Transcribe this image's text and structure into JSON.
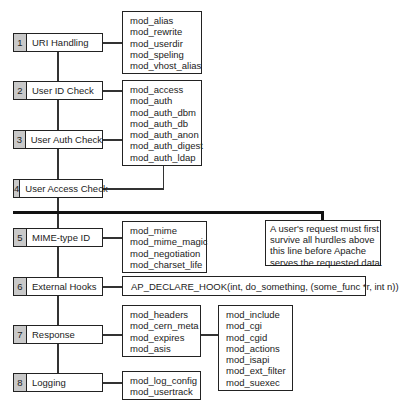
{
  "steps": [
    {
      "num": "1",
      "label": "URI Handling"
    },
    {
      "num": "2",
      "label": "User ID Check"
    },
    {
      "num": "3",
      "label": "User Auth Check"
    },
    {
      "num": "4",
      "label": "User Access Check"
    },
    {
      "num": "5",
      "label": "MIME-type ID"
    },
    {
      "num": "6",
      "label": "External Hooks"
    },
    {
      "num": "7",
      "label": "Response"
    },
    {
      "num": "8",
      "label": "Logging"
    }
  ],
  "modules": {
    "uri": [
      "mod_alias",
      "mod_rewrite",
      "mod_userdir",
      "mod_speling",
      "mod_vhost_alias"
    ],
    "auth": [
      "mod_access",
      "mod_auth",
      "mod_auth_dbm",
      "mod_auth_db",
      "mod_auth_anon",
      "mod_auth_digest",
      "mod_auth_ldap"
    ],
    "mime": [
      "mod_mime",
      "mod_mime_magic",
      "mod_negotiation",
      "mod_charset_life"
    ],
    "hook": "AP_DECLARE_HOOK(int, do_something, (some_func *r, int n))",
    "response_a": [
      "mod_headers",
      "mod_cern_meta",
      "mod_expires",
      "mod_asis"
    ],
    "response_b": [
      "mod_include",
      "mod_cgi",
      "mod_cgid",
      "mod_actions",
      "mod_isapi",
      "mod_ext_filter",
      "mod_suexec"
    ],
    "logging": [
      "mod_log_config",
      "mod_usertrack"
    ]
  },
  "note": {
    "lines": [
      "A user's request must first",
      "survive all hurdles above",
      "this line before Apache",
      "serves the requested data."
    ]
  }
}
